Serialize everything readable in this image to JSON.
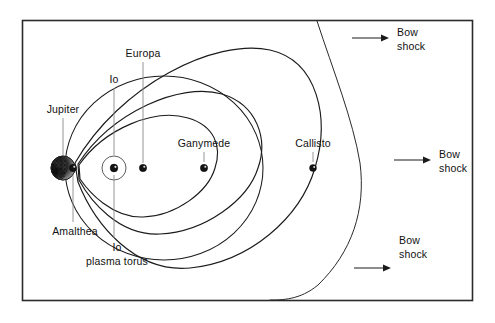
{
  "figure": {
    "kind": "schematic-diagram",
    "background_color": "#ffffff",
    "line_color": "#1b1b1b",
    "frame_color": "#2b2b2b",
    "leader_color": "#8a8a8a"
  },
  "labels": {
    "jupiter": "Jupiter",
    "io": "Io",
    "europa": "Europa",
    "ganymede": "Ganymede",
    "callisto": "Callisto",
    "amalthea": "Amalthea",
    "io_plasma_torus_line1": "Io",
    "io_plasma_torus_line2": "plasma torus",
    "bow_shock_top_line1": "Bow",
    "bow_shock_top_line2": "shock",
    "bow_shock_mid_line1": "Bow",
    "bow_shock_mid_line2": "shock",
    "bow_shock_bottom_line1": "Bow",
    "bow_shock_bottom_line2": "shock"
  },
  "bodies": [
    {
      "name": "Jupiter",
      "x": 63,
      "y": 168,
      "r": 12,
      "style": "textured-planet"
    },
    {
      "name": "Amalthea",
      "x": 73,
      "y": 168,
      "r": 3.6,
      "style": "dot"
    },
    {
      "name": "Io",
      "x": 114,
      "y": 168,
      "r": 3.8,
      "style": "dot-with-torus",
      "torus_r": 12
    },
    {
      "name": "Europa",
      "x": 143,
      "y": 168,
      "r": 3.6,
      "style": "dot"
    },
    {
      "name": "Ganymede",
      "x": 204,
      "y": 168,
      "r": 3.6,
      "style": "dot"
    },
    {
      "name": "Callisto",
      "x": 313,
      "y": 168,
      "r": 3.4,
      "style": "dot"
    }
  ],
  "icons": {
    "arrow_right": "arrow-right-icon",
    "planet": "planet-icon",
    "moon": "moon-dot-icon",
    "torus": "plasma-torus-icon"
  }
}
